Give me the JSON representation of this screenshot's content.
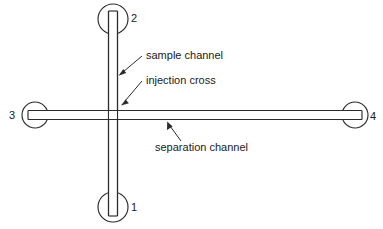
{
  "diagram": {
    "type": "schematic",
    "background_color": "#ffffff",
    "line_color": "#2b2b2b",
    "text_color": "#1a1a1a",
    "ports": [
      {
        "id": "port-2",
        "label": "2",
        "position": "top",
        "center_x": 113,
        "center_y": 19,
        "radius": 15,
        "label_x": 131,
        "label_y": 22
      },
      {
        "id": "port-1",
        "label": "1",
        "position": "bottom",
        "center_x": 113,
        "center_y": 207,
        "radius": 15,
        "label_x": 131,
        "label_y": 211
      },
      {
        "id": "port-3",
        "label": "3",
        "position": "left",
        "center_x": 35,
        "center_y": 115,
        "radius": 13,
        "label_x": 9,
        "label_y": 119
      },
      {
        "id": "port-4",
        "label": "4",
        "position": "right",
        "center_x": 355,
        "center_y": 115,
        "radius": 13,
        "label_x": 370,
        "label_y": 120
      }
    ],
    "channels": [
      {
        "id": "vertical-channel",
        "orientation": "vertical",
        "from_port": "port-2",
        "to_port": "port-1"
      },
      {
        "id": "horizontal-channel",
        "orientation": "horizontal",
        "from_port": "port-3",
        "to_port": "port-4"
      }
    ],
    "intersection": {
      "id": "injection-cross",
      "x": 113,
      "y": 115
    },
    "annotations": [
      {
        "id": "sample-channel",
        "text": "sample channel",
        "text_x": 146,
        "text_y": 59,
        "arrow_from_x": 142,
        "arrow_from_y": 56,
        "arrow_to_x": 120,
        "arrow_to_y": 75
      },
      {
        "id": "injection-cross",
        "text": "injection cross",
        "text_x": 146,
        "text_y": 84,
        "arrow_from_x": 142,
        "arrow_from_y": 81,
        "arrow_to_x": 122,
        "arrow_to_y": 104
      },
      {
        "id": "separation-channel",
        "text": "separation channel",
        "text_x": 155,
        "text_y": 151,
        "arrow_from_x": 180,
        "arrow_from_y": 141,
        "arrow_to_x": 168,
        "arrow_to_y": 122
      }
    ]
  }
}
